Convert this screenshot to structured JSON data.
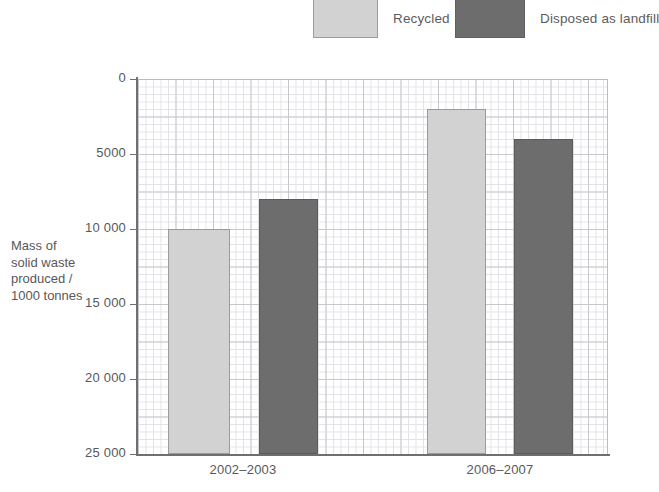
{
  "legend": {
    "position": "top",
    "items": [
      {
        "label": "Recycled",
        "color": "#d2d2d2",
        "swatch_name": "legend-swatch-recycled"
      },
      {
        "label": "Disposed as landfill",
        "color": "#6d6d6d",
        "swatch_name": "legend-swatch-landfill"
      }
    ]
  },
  "axes": {
    "y_title_lines": [
      "Mass of",
      "solid waste",
      "produced /",
      "1000 tonnes"
    ],
    "y_ticks": [
      "25 000",
      "20 000",
      "15 000",
      "10 000",
      "5000",
      "0"
    ],
    "x_ticks": [
      "2002–2003",
      "2006–2007"
    ]
  },
  "chart_data": {
    "type": "bar",
    "title": "",
    "subtitle": "",
    "xlabel": "",
    "ylabel": "Mass of solid waste produced / 1000 tonnes",
    "categories": [
      "2002–2003",
      "2006–2007"
    ],
    "series": [
      {
        "name": "Recycled",
        "color": "#d2d2d2",
        "values": [
          15000,
          23000
        ]
      },
      {
        "name": "Disposed as landfill",
        "color": "#6d6d6d",
        "values": [
          17000,
          21000
        ]
      }
    ],
    "ylim": [
      0,
      25000
    ],
    "ytick_values": [
      0,
      5000,
      10000,
      15000,
      20000,
      25000
    ],
    "ytick_labels": [
      "0",
      "5000",
      "10 000",
      "15 000",
      "20 000",
      "25 000"
    ],
    "grid": "graph-paper minor 250 units, major 1250 units",
    "legend_position": "top"
  },
  "bars": [
    {
      "name": "bar-recycled-2002-2003",
      "series": "Recycled",
      "category": "2002–2003",
      "value": 15000,
      "color": "#d2d2d2",
      "left": 168,
      "width": 62
    },
    {
      "name": "bar-landfill-2002-2003",
      "series": "Disposed as landfill",
      "category": "2002–2003",
      "value": 17000,
      "color": "#6d6d6d",
      "left": 259,
      "width": 59
    },
    {
      "name": "bar-recycled-2006-2007",
      "series": "Recycled",
      "category": "2006–2007",
      "value": 23000,
      "color": "#d2d2d2",
      "left": 427,
      "width": 59
    },
    {
      "name": "bar-landfill-2006-2007",
      "series": "Disposed as landfill",
      "category": "2006–2007",
      "value": 21000,
      "color": "#6d6d6d",
      "left": 514,
      "width": 59
    }
  ]
}
